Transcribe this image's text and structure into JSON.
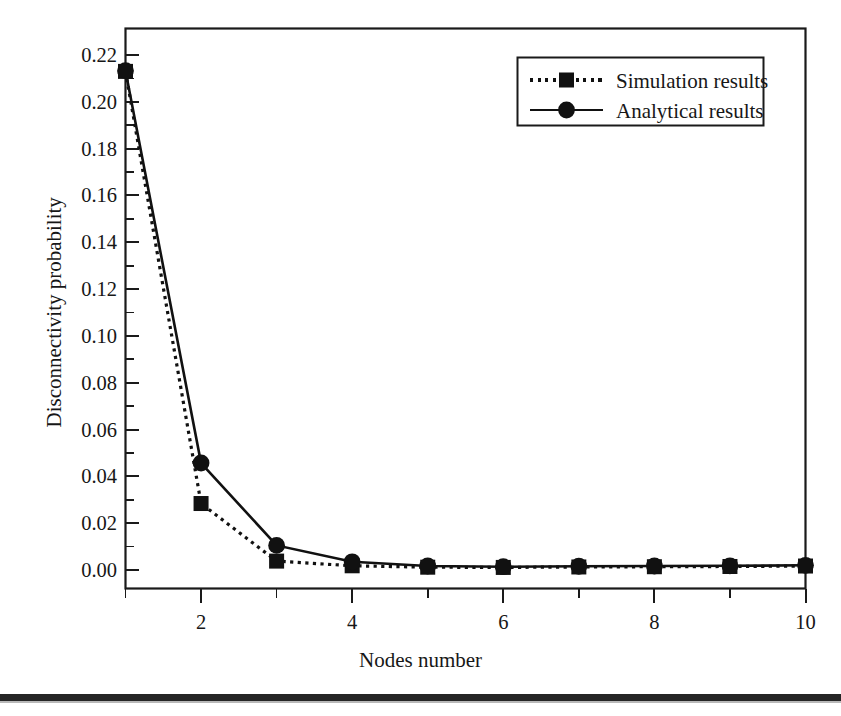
{
  "figure": {
    "axis_color": "#1a1a1a",
    "series_color": "#111111",
    "background": "#ffffff"
  },
  "axes": {
    "y_title": "Disconnectivity probability",
    "x_title": "Nodes number",
    "y_ticks": [
      "0.00",
      "0.02",
      "0.04",
      "0.06",
      "0.08",
      "0.10",
      "0.12",
      "0.14",
      "0.16",
      "0.18",
      "0.20",
      "0.22"
    ],
    "x_ticks": [
      "2",
      "4",
      "6",
      "8",
      "10"
    ]
  },
  "legend": {
    "items": [
      {
        "label": "Simulation results",
        "marker": "square",
        "line": "dotted"
      },
      {
        "label": "Analytical results",
        "marker": "circle",
        "line": "solid"
      }
    ]
  },
  "page": {
    "rule_color": "#262626"
  },
  "chart_data": {
    "type": "line",
    "title": "",
    "xlabel": "Nodes number",
    "ylabel": "Disconnectivity probability",
    "x": [
      1,
      2,
      3,
      4,
      5,
      6,
      7,
      8,
      9,
      10
    ],
    "xlim": [
      1,
      10
    ],
    "ylim": [
      0.0,
      0.23
    ],
    "y_major_ticks": [
      0.0,
      0.02,
      0.04,
      0.06,
      0.08,
      0.1,
      0.12,
      0.14,
      0.16,
      0.18,
      0.2,
      0.22
    ],
    "y_minor_ticks": [
      0.01,
      0.03,
      0.05,
      0.07,
      0.09,
      0.11,
      0.13,
      0.15,
      0.17,
      0.19,
      0.21
    ],
    "x_major_ticks": [
      2,
      4,
      6,
      8,
      10
    ],
    "x_minor_ticks": [
      1,
      3,
      5,
      7,
      9
    ],
    "grid": false,
    "legend_position": "top-right",
    "series": [
      {
        "name": "Simulation results",
        "marker": "square",
        "linestyle": "dotted",
        "color": "#111111",
        "values": [
          0.213,
          0.0284,
          0.0038,
          0.0018,
          0.0012,
          0.0011,
          0.0013,
          0.0014,
          0.0015,
          0.0017
        ]
      },
      {
        "name": "Analytical results",
        "marker": "circle",
        "linestyle": "solid",
        "color": "#111111",
        "values": [
          0.2133,
          0.0457,
          0.0105,
          0.0035,
          0.0017,
          0.0014,
          0.0016,
          0.0017,
          0.0018,
          0.002
        ]
      }
    ]
  }
}
